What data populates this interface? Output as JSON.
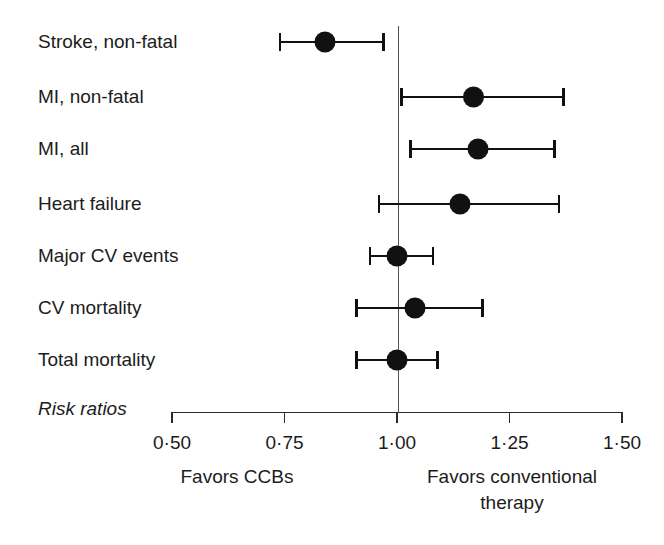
{
  "figure": {
    "axis_note": "Risk ratios",
    "left_caption": "Favors CCBs",
    "right_caption_line1": "Favors conventional",
    "right_caption_line2": "therapy"
  },
  "chart_data": {
    "type": "scatter",
    "subtype": "forest-plot",
    "title": "",
    "xlabel": "Risk ratios",
    "ylabel": "",
    "xlim": [
      0.5,
      1.5
    ],
    "xscale": "linear",
    "grid": false,
    "legend": "none",
    "null_line": 1.0,
    "tick_labels": [
      "0·50",
      "0·75",
      "1·00",
      "1·25",
      "1·50"
    ],
    "tick_values": [
      0.5,
      0.75,
      1.0,
      1.25,
      1.5
    ],
    "left_caption": "Favors CCBs",
    "right_caption": "Favors conventional therapy",
    "categories": [
      "Stroke, non-fatal",
      "MI, non-fatal",
      "MI, all",
      "Heart failure",
      "Major CV events",
      "CV mortality",
      "Total mortality"
    ],
    "points": [
      {
        "label": "Stroke, non-fatal",
        "estimate": 0.84,
        "ci_low": 0.74,
        "ci_high": 0.97
      },
      {
        "label": "MI, non-fatal",
        "estimate": 1.17,
        "ci_low": 1.01,
        "ci_high": 1.37
      },
      {
        "label": "MI, all",
        "estimate": 1.18,
        "ci_low": 1.03,
        "ci_high": 1.35
      },
      {
        "label": "Heart failure",
        "estimate": 1.14,
        "ci_low": 0.96,
        "ci_high": 1.36
      },
      {
        "label": "Major CV events",
        "estimate": 1.0,
        "ci_low": 0.94,
        "ci_high": 1.08
      },
      {
        "label": "CV mortality",
        "estimate": 1.04,
        "ci_low": 0.91,
        "ci_high": 1.19
      },
      {
        "label": "Total mortality",
        "estimate": 1.0,
        "ci_low": 0.91,
        "ci_high": 1.09
      }
    ]
  }
}
